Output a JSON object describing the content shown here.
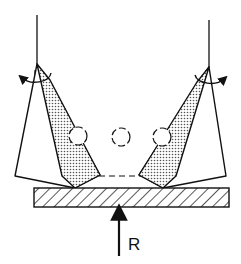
{
  "diagram": {
    "type": "mechanical-linkage",
    "labels": {
      "force": "R"
    },
    "colors": {
      "stroke": "#111111",
      "shade": "#b8b8b8",
      "background": "#ffffff"
    },
    "elements": {
      "left_pivot": {
        "x": 37,
        "y": 64
      },
      "right_pivot": {
        "x": 209,
        "y": 67
      },
      "circles": [
        {
          "cx": 78,
          "cy": 136,
          "r": 9,
          "style": "dashed"
        },
        {
          "cx": 121,
          "cy": 137,
          "r": 9,
          "style": "dashed"
        },
        {
          "cx": 162,
          "cy": 137,
          "r": 9,
          "style": "dashed"
        }
      ],
      "base_bar": {
        "x": 34,
        "y": 188,
        "width": 195,
        "height": 19,
        "fill": "hatched"
      },
      "force_arrow": {
        "x": 119,
        "y_from": 256,
        "y_to": 207,
        "direction": "up"
      }
    }
  }
}
